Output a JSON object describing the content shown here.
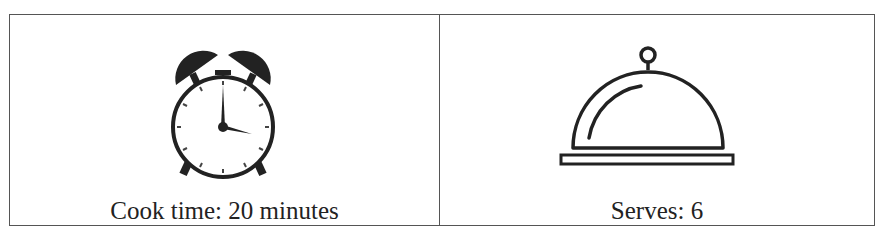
{
  "cells": [
    {
      "icon": "alarm-clock-icon",
      "label": "Cook time: 20 minutes"
    },
    {
      "icon": "serving-cloche-icon",
      "label": "Serves: 6"
    }
  ],
  "colors": {
    "border": "#555555",
    "icon": "#222222",
    "text": "#222222"
  }
}
